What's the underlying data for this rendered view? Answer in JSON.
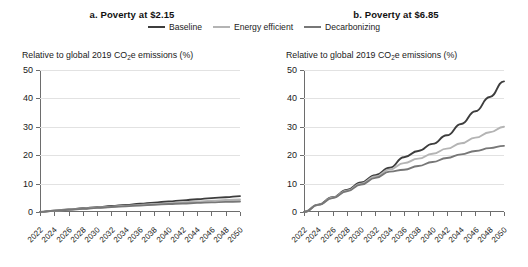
{
  "legend": {
    "items": [
      {
        "label": "Baseline",
        "color": "#3d3d3d"
      },
      {
        "label": "Energy efficient",
        "color": "#b4b4b4"
      },
      {
        "label": "Decarbonizing",
        "color": "#777777"
      }
    ]
  },
  "panels": [
    {
      "id": "a",
      "title": "a. Poverty at $2.15",
      "axis_title_pre": "Relative to global 2019 CO",
      "axis_title_sub": "2",
      "axis_title_post": "e emissions (%)"
    },
    {
      "id": "b",
      "title": "b. Poverty at $6.85",
      "axis_title_pre": "Relative to global 2019 CO",
      "axis_title_sub": "2",
      "axis_title_post": "e emissions (%)"
    }
  ],
  "chart_data": [
    {
      "type": "line",
      "title": "a. Poverty at $2.15",
      "xlabel": "",
      "ylabel": "Relative to global 2019 CO2e emissions (%)",
      "ylim": [
        0,
        50
      ],
      "yticks": [
        0,
        10,
        20,
        30,
        40,
        50
      ],
      "grid": true,
      "legend_position": "top-center-shared",
      "x": [
        2022,
        2024,
        2026,
        2028,
        2030,
        2032,
        2034,
        2036,
        2038,
        2040,
        2042,
        2044,
        2046,
        2048,
        2050
      ],
      "categories": [
        "2022",
        "2024",
        "2026",
        "2028",
        "2030",
        "2032",
        "2034",
        "2036",
        "2038",
        "2040",
        "2042",
        "2044",
        "2046",
        "2048",
        "2050"
      ],
      "series": [
        {
          "name": "Baseline",
          "color": "#3d3d3d",
          "values": [
            0,
            0.5,
            0.9,
            1.3,
            1.7,
            2.1,
            2.5,
            2.9,
            3.3,
            3.7,
            4.1,
            4.5,
            4.9,
            5.2,
            5.6
          ]
        },
        {
          "name": "Energy efficient",
          "color": "#b4b4b4",
          "values": [
            0,
            0.45,
            0.8,
            1.15,
            1.5,
            1.85,
            2.2,
            2.5,
            2.8,
            3.1,
            3.4,
            3.7,
            3.95,
            4.2,
            4.4
          ]
        },
        {
          "name": "Decarbonizing",
          "color": "#777777",
          "values": [
            0,
            0.45,
            0.8,
            1.1,
            1.45,
            1.75,
            2.05,
            2.3,
            2.55,
            2.8,
            3.0,
            3.2,
            3.4,
            3.55,
            3.7
          ]
        }
      ]
    },
    {
      "type": "line",
      "title": "b. Poverty at $6.85",
      "xlabel": "",
      "ylabel": "Relative to global 2019 CO2e emissions (%)",
      "ylim": [
        0,
        50
      ],
      "yticks": [
        0,
        10,
        20,
        30,
        40,
        50
      ],
      "grid": true,
      "legend_position": "top-center-shared",
      "x": [
        2022,
        2024,
        2026,
        2028,
        2030,
        2032,
        2034,
        2036,
        2038,
        2040,
        2042,
        2044,
        2046,
        2048,
        2050
      ],
      "categories": [
        "2022",
        "2024",
        "2026",
        "2028",
        "2030",
        "2032",
        "2034",
        "2036",
        "2038",
        "2040",
        "2042",
        "2044",
        "2046",
        "2048",
        "2050"
      ],
      "series": [
        {
          "name": "Baseline",
          "color": "#3d3d3d",
          "values": [
            0,
            2.6,
            5.2,
            7.8,
            10.4,
            13.0,
            15.6,
            19.3,
            21.5,
            24.0,
            27.0,
            31.0,
            35.5,
            40.5,
            46.0
          ]
        },
        {
          "name": "Energy efficient",
          "color": "#b4b4b4",
          "values": [
            0,
            2.5,
            5.0,
            7.5,
            10.0,
            12.5,
            15.0,
            17.2,
            18.8,
            20.5,
            22.3,
            24.2,
            26.2,
            28.1,
            30.0
          ]
        },
        {
          "name": "Decarbonizing",
          "color": "#777777",
          "values": [
            0,
            2.5,
            4.9,
            7.3,
            9.7,
            12.0,
            14.2,
            14.9,
            16.2,
            17.6,
            19.0,
            20.3,
            21.5,
            22.5,
            23.3
          ]
        }
      ]
    }
  ]
}
